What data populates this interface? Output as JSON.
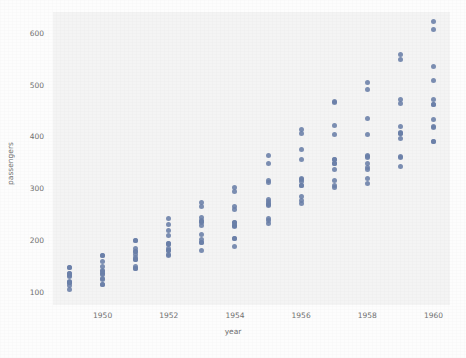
{
  "figure": {
    "background_color": "#fdfdfd",
    "plot_background_color": "#f4f4f4",
    "marker_color": "#6a7fa8"
  },
  "chart_data": {
    "type": "scatter",
    "title": "",
    "xlabel": "year",
    "ylabel": "passengers",
    "xlim": [
      1948.5,
      1960.5
    ],
    "ylim": [
      75,
      640
    ],
    "grid": false,
    "legend": null,
    "xticks": [
      1950,
      1952,
      1954,
      1956,
      1958,
      1960
    ],
    "yticks": [
      100,
      200,
      300,
      400,
      500,
      600
    ],
    "xtick_labels": [
      "1950",
      "1952",
      "1954",
      "1956",
      "1958",
      "1960"
    ],
    "ytick_labels": [
      "100",
      "200",
      "300",
      "400",
      "500",
      "600"
    ],
    "series": [
      {
        "name": "passengers",
        "points": [
          [
            1949,
            112
          ],
          [
            1949,
            118
          ],
          [
            1949,
            132
          ],
          [
            1949,
            129
          ],
          [
            1949,
            121
          ],
          [
            1949,
            135
          ],
          [
            1949,
            148
          ],
          [
            1949,
            148
          ],
          [
            1949,
            136
          ],
          [
            1949,
            119
          ],
          [
            1949,
            104
          ],
          [
            1949,
            118
          ],
          [
            1950,
            115
          ],
          [
            1950,
            126
          ],
          [
            1950,
            141
          ],
          [
            1950,
            135
          ],
          [
            1950,
            125
          ],
          [
            1950,
            149
          ],
          [
            1950,
            170
          ],
          [
            1950,
            170
          ],
          [
            1950,
            158
          ],
          [
            1950,
            133
          ],
          [
            1950,
            114
          ],
          [
            1950,
            140
          ],
          [
            1951,
            145
          ],
          [
            1951,
            150
          ],
          [
            1951,
            178
          ],
          [
            1951,
            163
          ],
          [
            1951,
            172
          ],
          [
            1951,
            178
          ],
          [
            1951,
            199
          ],
          [
            1951,
            199
          ],
          [
            1951,
            184
          ],
          [
            1951,
            162
          ],
          [
            1951,
            146
          ],
          [
            1951,
            166
          ],
          [
            1952,
            171
          ],
          [
            1952,
            180
          ],
          [
            1952,
            193
          ],
          [
            1952,
            181
          ],
          [
            1952,
            183
          ],
          [
            1952,
            218
          ],
          [
            1952,
            230
          ],
          [
            1952,
            242
          ],
          [
            1952,
            209
          ],
          [
            1952,
            191
          ],
          [
            1952,
            172
          ],
          [
            1952,
            194
          ],
          [
            1953,
            196
          ],
          [
            1953,
            196
          ],
          [
            1953,
            236
          ],
          [
            1953,
            235
          ],
          [
            1953,
            229
          ],
          [
            1953,
            243
          ],
          [
            1953,
            264
          ],
          [
            1953,
            272
          ],
          [
            1953,
            237
          ],
          [
            1953,
            211
          ],
          [
            1953,
            180
          ],
          [
            1953,
            201
          ],
          [
            1954,
            204
          ],
          [
            1954,
            188
          ],
          [
            1954,
            235
          ],
          [
            1954,
            227
          ],
          [
            1954,
            234
          ],
          [
            1954,
            264
          ],
          [
            1954,
            302
          ],
          [
            1954,
            293
          ],
          [
            1954,
            259
          ],
          [
            1954,
            229
          ],
          [
            1954,
            203
          ],
          [
            1954,
            229
          ],
          [
            1955,
            242
          ],
          [
            1955,
            233
          ],
          [
            1955,
            267
          ],
          [
            1955,
            269
          ],
          [
            1955,
            270
          ],
          [
            1955,
            315
          ],
          [
            1955,
            364
          ],
          [
            1955,
            347
          ],
          [
            1955,
            312
          ],
          [
            1955,
            274
          ],
          [
            1955,
            237
          ],
          [
            1955,
            278
          ],
          [
            1956,
            284
          ],
          [
            1956,
            277
          ],
          [
            1956,
            317
          ],
          [
            1956,
            313
          ],
          [
            1956,
            318
          ],
          [
            1956,
            374
          ],
          [
            1956,
            413
          ],
          [
            1956,
            405
          ],
          [
            1956,
            355
          ],
          [
            1956,
            306
          ],
          [
            1956,
            271
          ],
          [
            1956,
            306
          ],
          [
            1957,
            315
          ],
          [
            1957,
            301
          ],
          [
            1957,
            356
          ],
          [
            1957,
            348
          ],
          [
            1957,
            355
          ],
          [
            1957,
            422
          ],
          [
            1957,
            465
          ],
          [
            1957,
            467
          ],
          [
            1957,
            404
          ],
          [
            1957,
            347
          ],
          [
            1957,
            305
          ],
          [
            1957,
            336
          ],
          [
            1958,
            340
          ],
          [
            1958,
            318
          ],
          [
            1958,
            362
          ],
          [
            1958,
            348
          ],
          [
            1958,
            363
          ],
          [
            1958,
            435
          ],
          [
            1958,
            491
          ],
          [
            1958,
            505
          ],
          [
            1958,
            404
          ],
          [
            1958,
            359
          ],
          [
            1958,
            310
          ],
          [
            1958,
            337
          ],
          [
            1959,
            360
          ],
          [
            1959,
            342
          ],
          [
            1959,
            406
          ],
          [
            1959,
            396
          ],
          [
            1959,
            420
          ],
          [
            1959,
            472
          ],
          [
            1959,
            548
          ],
          [
            1959,
            559
          ],
          [
            1959,
            463
          ],
          [
            1959,
            407
          ],
          [
            1959,
            362
          ],
          [
            1959,
            405
          ],
          [
            1960,
            417
          ],
          [
            1960,
            391
          ],
          [
            1960,
            419
          ],
          [
            1960,
            461
          ],
          [
            1960,
            472
          ],
          [
            1960,
            535
          ],
          [
            1960,
            622
          ],
          [
            1960,
            606
          ],
          [
            1960,
            508
          ],
          [
            1960,
            461
          ],
          [
            1960,
            390
          ],
          [
            1960,
            432
          ]
        ]
      }
    ]
  }
}
